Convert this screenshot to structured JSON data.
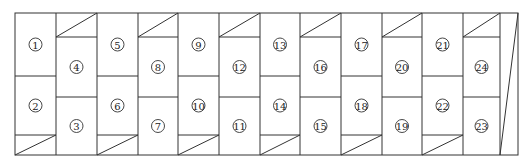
{
  "diagram": {
    "type": "panel-layout",
    "outline": {
      "left": 15,
      "top": 13,
      "right": 518,
      "bottom": 155
    },
    "column_edges": [
      15,
      56,
      97,
      138,
      178,
      219,
      260,
      300,
      341,
      382,
      422,
      463,
      500
    ],
    "odd_column": {
      "split_y": 76,
      "triangle_top_y": 135,
      "triangle_position": "bottom"
    },
    "even_column": {
      "split_y": 97,
      "triangle_bottom_y": 37,
      "triangle_position": "top"
    },
    "end_wedge": {
      "x_left": 500,
      "x_right": 518,
      "description": "thin triangular sliver"
    },
    "panels": [
      {
        "label": "1",
        "column": 0,
        "row": "upper"
      },
      {
        "label": "2",
        "column": 0,
        "row": "lower"
      },
      {
        "label": "3",
        "column": 1,
        "row": "lower"
      },
      {
        "label": "4",
        "column": 1,
        "row": "upper"
      },
      {
        "label": "5",
        "column": 2,
        "row": "upper"
      },
      {
        "label": "6",
        "column": 2,
        "row": "lower"
      },
      {
        "label": "7",
        "column": 3,
        "row": "lower"
      },
      {
        "label": "8",
        "column": 3,
        "row": "upper"
      },
      {
        "label": "9",
        "column": 4,
        "row": "upper"
      },
      {
        "label": "10",
        "column": 4,
        "row": "lower"
      },
      {
        "label": "11",
        "column": 5,
        "row": "lower"
      },
      {
        "label": "12",
        "column": 5,
        "row": "upper"
      },
      {
        "label": "13",
        "column": 6,
        "row": "upper"
      },
      {
        "label": "14",
        "column": 6,
        "row": "lower"
      },
      {
        "label": "15",
        "column": 7,
        "row": "lower"
      },
      {
        "label": "16",
        "column": 7,
        "row": "upper"
      },
      {
        "label": "17",
        "column": 8,
        "row": "upper"
      },
      {
        "label": "18",
        "column": 8,
        "row": "lower"
      },
      {
        "label": "19",
        "column": 9,
        "row": "lower"
      },
      {
        "label": "20",
        "column": 9,
        "row": "upper"
      },
      {
        "label": "21",
        "column": 10,
        "row": "upper"
      },
      {
        "label": "22",
        "column": 10,
        "row": "lower"
      },
      {
        "label": "23",
        "column": 11,
        "row": "lower"
      },
      {
        "label": "24",
        "column": 11,
        "row": "upper"
      }
    ]
  }
}
